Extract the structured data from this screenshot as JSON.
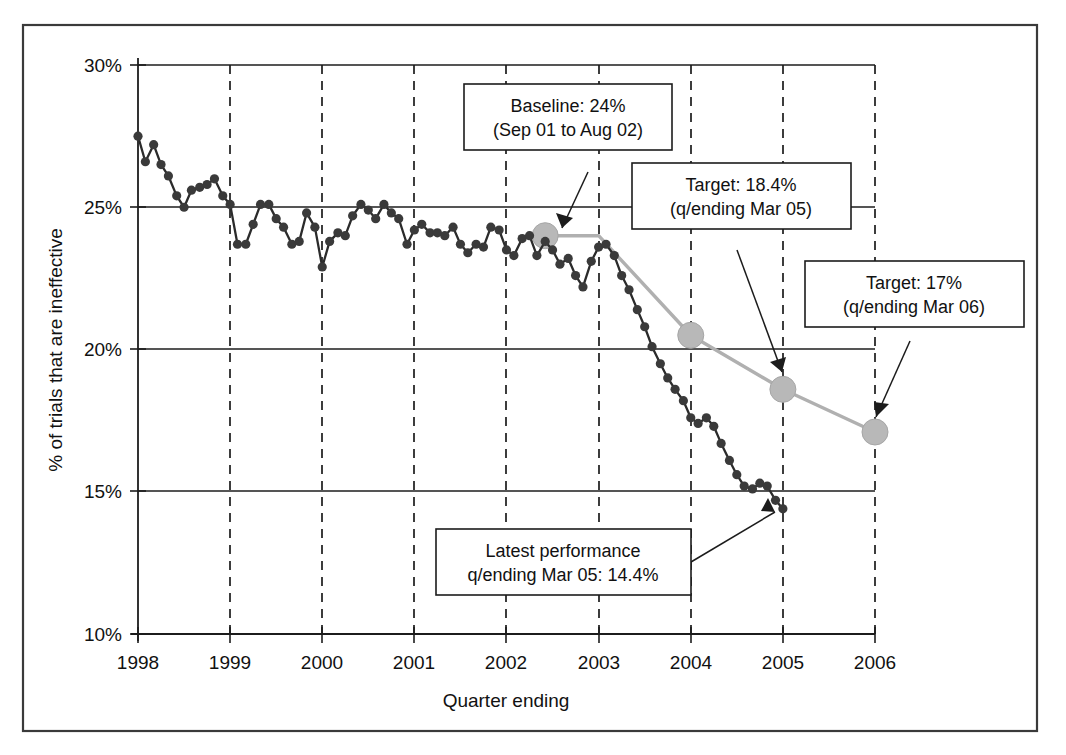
{
  "chart_data": {
    "type": "line",
    "title": "",
    "xlabel": "Quarter ending",
    "ylabel": "% of trials that are ineffective",
    "xlim": [
      1998,
      2006
    ],
    "ylim": [
      10,
      30
    ],
    "grid": "horizontal gridlines at each 5% tick; vertical dashed gridlines at each year tick",
    "legend": "none",
    "x_tick_labels": [
      "1998",
      "1999",
      "2000",
      "2001",
      "2002",
      "2003",
      "2004",
      "2005",
      "2006"
    ],
    "y_tick_labels": [
      "10%",
      "15%",
      "20%",
      "25%",
      "30%"
    ],
    "series": [
      {
        "name": "Actual performance (% of trials that are ineffective)",
        "style": "dark line with round markers, quarterly/monthly points",
        "x": [
          1998.0,
          1998.08,
          1998.17,
          1998.25,
          1998.33,
          1998.42,
          1998.5,
          1998.58,
          1998.67,
          1998.75,
          1998.83,
          1998.92,
          1999.0,
          1999.08,
          1999.17,
          1999.25,
          1999.33,
          1999.42,
          1999.5,
          1999.58,
          1999.67,
          1999.75,
          1999.83,
          1999.92,
          2000.0,
          2000.08,
          2000.17,
          2000.25,
          2000.33,
          2000.42,
          2000.5,
          2000.58,
          2000.67,
          2000.75,
          2000.83,
          2000.92,
          2001.0,
          2001.08,
          2001.17,
          2001.25,
          2001.33,
          2001.42,
          2001.5,
          2001.58,
          2001.67,
          2001.75,
          2001.83,
          2001.92,
          2002.0,
          2002.08,
          2002.17,
          2002.25,
          2002.33,
          2002.42,
          2002.5,
          2002.58,
          2002.67,
          2002.75,
          2002.83,
          2002.92,
          2003.0,
          2003.08,
          2003.17,
          2003.25,
          2003.33,
          2003.42,
          2003.5,
          2003.58,
          2003.67,
          2003.75,
          2003.83,
          2003.92,
          2004.0,
          2004.08,
          2004.17,
          2004.25,
          2004.33,
          2004.42,
          2004.5,
          2004.58,
          2004.67,
          2004.75,
          2004.83,
          2004.92,
          2005.0
        ],
        "values": [
          27.5,
          26.6,
          27.2,
          26.5,
          26.1,
          25.4,
          25.0,
          25.6,
          25.7,
          25.8,
          26.0,
          25.4,
          25.1,
          23.7,
          23.7,
          24.4,
          25.1,
          25.1,
          24.6,
          24.3,
          23.7,
          23.8,
          24.8,
          24.3,
          22.9,
          23.8,
          24.1,
          24.0,
          24.7,
          25.1,
          24.9,
          24.6,
          25.1,
          24.8,
          24.6,
          23.7,
          24.2,
          24.4,
          24.1,
          24.1,
          24.0,
          24.3,
          23.7,
          23.4,
          23.7,
          23.6,
          24.3,
          24.2,
          23.5,
          23.3,
          23.9,
          24.0,
          23.3,
          23.8,
          23.5,
          23.0,
          23.2,
          22.6,
          22.2,
          23.1,
          23.6,
          23.7,
          23.3,
          22.6,
          22.1,
          21.4,
          20.8,
          20.1,
          19.5,
          19.0,
          18.6,
          18.2,
          17.6,
          17.4,
          17.6,
          17.3,
          16.7,
          16.1,
          15.6,
          15.2,
          15.1,
          15.3,
          15.2,
          14.7,
          14.4
        ]
      },
      {
        "name": "Target trajectory",
        "style": "light grey line with large grey markers",
        "x": [
          2002.42,
          2003.0,
          2004.0,
          2005.0,
          2006.0
        ],
        "values": [
          24.0,
          24.0,
          20.5,
          18.6,
          17.1
        ],
        "markers_at": [
          2002.42,
          2004.0,
          2005.0,
          2006.0
        ]
      }
    ],
    "annotations": [
      {
        "id": "baseline",
        "line1": "Baseline: 24%",
        "line2": "(Sep 01 to Aug 02)",
        "points_to_value": "24%",
        "points_to_x": "2002 Q3"
      },
      {
        "id": "target-mar-05",
        "line1": "Target: 18.4%",
        "line2": "(q/ending Mar 05)",
        "points_to_value": "18.4%",
        "points_to_x": "2005"
      },
      {
        "id": "target-mar-06",
        "line1": "Target: 17%",
        "line2": "(q/ending Mar 06)",
        "points_to_value": "17%",
        "points_to_x": "2006"
      },
      {
        "id": "latest-performance",
        "line1": "Latest performance",
        "line2": "q/ending Mar 05: 14.4%",
        "points_to_value": "14.4%",
        "points_to_x": "2005"
      }
    ],
    "colors": {
      "actual_series": "#2b2b2b",
      "target_series": "#b0b0b0",
      "axis": "#1c1c1c",
      "frame": "#3a3a3a",
      "background": "#ffffff"
    }
  }
}
